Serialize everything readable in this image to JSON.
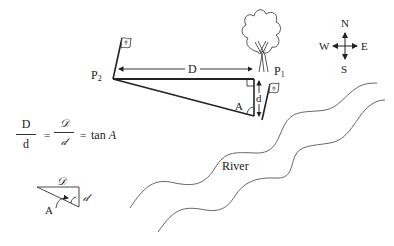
{
  "diagram": {
    "labels": {
      "p2": "P",
      "p2_sub": "2",
      "p1": "P",
      "p1_sub": "1",
      "distance_D": "D",
      "distance_d": "d",
      "angle_A": "A",
      "river": "River"
    },
    "compass": {
      "north": "N",
      "south": "S",
      "east": "E",
      "west": "W"
    },
    "formula": {
      "num1": "D",
      "den1": "d",
      "eq1": "=",
      "num2": "𝒟",
      "den2": "𝒹",
      "eq2": "=",
      "rhs_prefix": "tan",
      "rhs_var": "A"
    },
    "small_triangle": {
      "side_D": "𝒟",
      "side_d": "𝒹",
      "angle_A": "A"
    },
    "icons": [
      "flag-icon",
      "tree-icon",
      "compass-icon",
      "right-angle-marker"
    ],
    "colors": {
      "line": "#222222",
      "river": "#555555",
      "background": "#ffffff"
    }
  }
}
